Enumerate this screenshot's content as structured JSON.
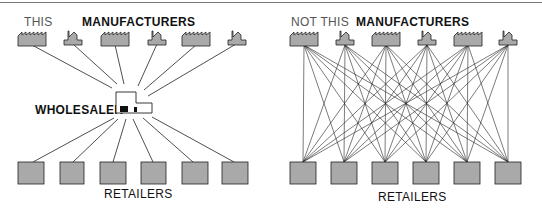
{
  "left_panel": {
    "caption": "THIS",
    "manufacturers_label": "MANUFACTURERS",
    "wholesaler_label": "WHOLESALER",
    "retailers_label": "RETAILERS"
  },
  "right_panel": {
    "caption": "NOT THIS",
    "manufacturers_label": "MANUFACTURERS",
    "retailers_label": "RETAILERS"
  },
  "manufacturers": [
    {
      "type": "sawtooth-factory"
    },
    {
      "type": "chimney-factory"
    },
    {
      "type": "sawtooth-factory"
    },
    {
      "type": "chimney-factory"
    },
    {
      "type": "sawtooth-factory"
    },
    {
      "type": "chimney-factory"
    }
  ],
  "retailer_count": 6,
  "colors": {
    "fill": "#a9a9a9",
    "stroke": "#222222",
    "line": "#222222"
  }
}
